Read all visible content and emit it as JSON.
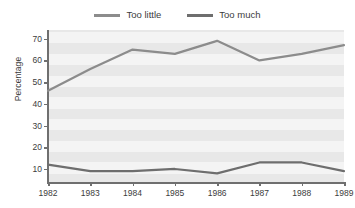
{
  "chart_data": {
    "type": "line",
    "title": "",
    "subtitle": "",
    "xlabel": "",
    "ylabel": "Percentage",
    "categories": [
      "1982",
      "1983",
      "1984",
      "1985",
      "1986",
      "1987",
      "1988",
      "1989"
    ],
    "x": [
      1982,
      1983,
      1984,
      1985,
      1986,
      1987,
      1988,
      1989
    ],
    "xlim": [
      1982,
      1989
    ],
    "ylim": [
      4,
      74
    ],
    "yticks": [
      10,
      20,
      30,
      40,
      50,
      60,
      70
    ],
    "ytick_labels": [
      "10",
      "20",
      "30",
      "40",
      "50",
      "60",
      "70"
    ],
    "grid": "horizontal-bands",
    "legend_position": "top-center",
    "series": [
      {
        "name": "Too little",
        "color": "#8c8c8c",
        "values": [
          46,
          56,
          65,
          63,
          69,
          60,
          63,
          67
        ]
      },
      {
        "name": "Too much",
        "color": "#6e6e6e",
        "values": [
          12,
          9,
          9,
          10,
          8,
          13,
          13,
          9
        ]
      }
    ]
  },
  "legend": {
    "entries": [
      {
        "label": "Too little",
        "swatch_name": "legend-swatch-too-little"
      },
      {
        "label": "Too much",
        "swatch_name": "legend-swatch-too-much"
      }
    ]
  },
  "axes": {
    "y_title": "Percentage"
  },
  "colors": {
    "plot_background": "#e8e8e8",
    "band": "#f4f4f4",
    "axis": "#6f6f6f",
    "text": "#3c3c3c",
    "series_too_little": "#8c8c8c",
    "series_too_much": "#6e6e6e"
  }
}
